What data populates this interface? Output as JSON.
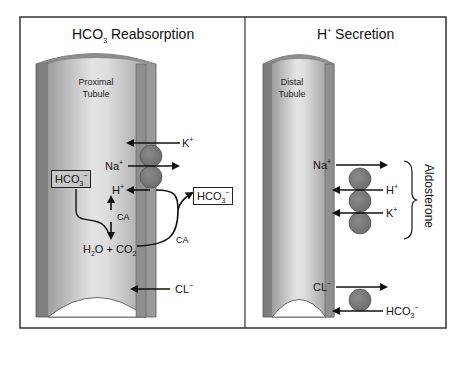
{
  "panels": [
    {
      "title_main": "HCO",
      "title_sub": "3",
      "title_rest": " Reabsorption",
      "tubule_label_line1": "Proximal",
      "tubule_label_line2": "Tubule",
      "labels": {
        "k": "K",
        "k_sup": "+",
        "na": "Na",
        "na_sup": "+",
        "h": "H",
        "h_sup": "+",
        "hco3_in": "HCO",
        "hco3_in_sub": "3",
        "hco3_in_sup": "−",
        "hco3_out": "HCO",
        "hco3_out_sub": "3",
        "hco3_out_sup": "−",
        "ca_inner": "CA",
        "ca_outer": "CA",
        "h2o": "H",
        "h2o_sub": "2",
        "h2o_rest": "O + CO",
        "co2_sub": "2",
        "cl": "CL",
        "cl_sup": "−"
      }
    },
    {
      "title_main": "H",
      "title_sup": "+",
      "title_rest": " Secretion",
      "tubule_label_line1": "Distal",
      "tubule_label_line2": "Tubule",
      "labels": {
        "na": "Na",
        "na_sup": "+",
        "h": "H",
        "h_sup": "+",
        "k": "K",
        "k_sup": "+",
        "cl": "CL",
        "cl_sup": "−",
        "hco3": "HCO",
        "hco3_sub": "3",
        "hco3_sup": "−",
        "aldosterone": "Aldosterone"
      }
    }
  ],
  "colors": {
    "frame": "#333333",
    "tubule_wall": "#8f8f8f",
    "tubule_light": "#e6e6e6",
    "tubule_dark": "#a8a8a8",
    "transporter": "#7a7a7a"
  }
}
